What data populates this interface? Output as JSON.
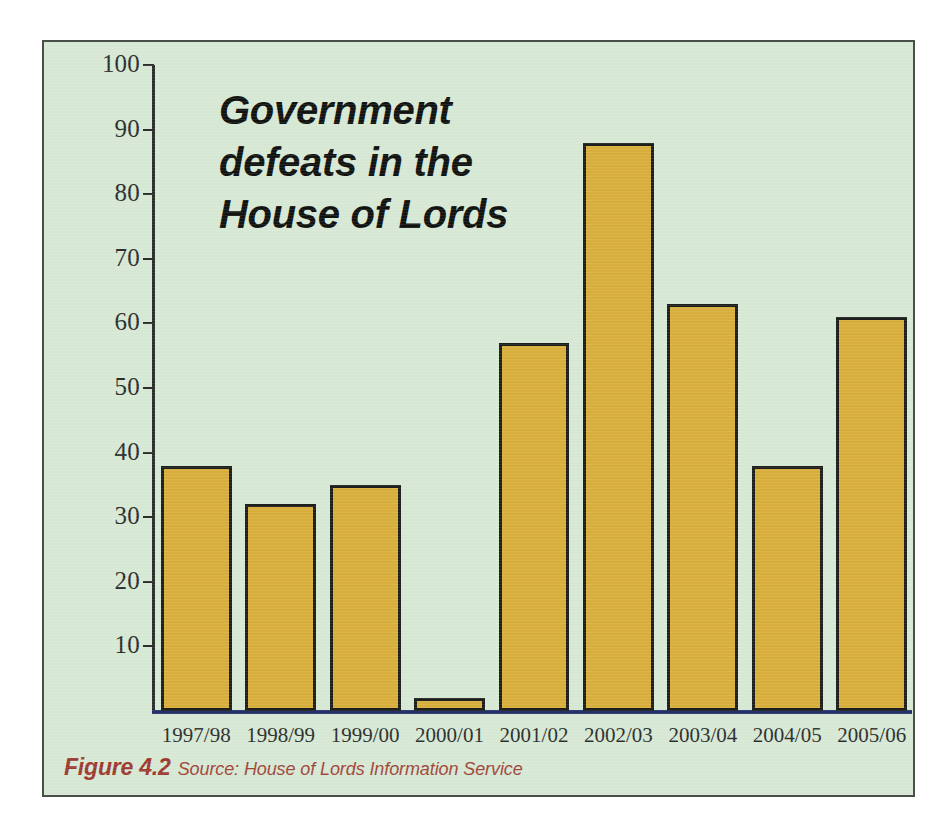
{
  "figure": {
    "background_color": "#d7e8d5",
    "border_color": "#4a4f49",
    "caption_label": "Figure 4.2",
    "caption_source": "Source: House of Lords Information Service",
    "caption_color": "#9e3a30"
  },
  "chart_data": {
    "type": "bar",
    "title": "Government defeats in the House of Lords",
    "xlabel": "",
    "ylabel": "",
    "categories": [
      "1997/98",
      "1998/99",
      "1999/00",
      "2000/01",
      "2001/02",
      "2002/03",
      "2003/04",
      "2004/05",
      "2005/06"
    ],
    "values": [
      38,
      32,
      35,
      2,
      57,
      88,
      63,
      38,
      61
    ],
    "ylim": [
      0,
      100
    ],
    "ytick_values": [
      10,
      20,
      30,
      40,
      50,
      60,
      70,
      80,
      90,
      100
    ],
    "ytick_labels": [
      "10",
      "20",
      "30",
      "40",
      "50",
      "60",
      "70",
      "80",
      "90",
      "100"
    ],
    "grid": false,
    "legend": false,
    "bar_fill_color": "#d8ae3c",
    "bar_edge_color": "#1d1f1c",
    "axis_color": "#2b2f2c"
  }
}
